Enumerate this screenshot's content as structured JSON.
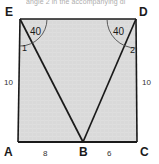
{
  "figure": {
    "caption": "angle 2 in the accompanying di",
    "shape_type": "quadrilateral-with-inscribed-triangle",
    "fill_color": "#d9d9d9",
    "stroke_color": "#1a1a1a",
    "arc_color": "#555555",
    "vertices": [
      {
        "id": "E",
        "label": "E",
        "x": 20,
        "y": 19
      },
      {
        "id": "D",
        "label": "D",
        "x": 136,
        "y": 19
      },
      {
        "id": "A",
        "label": "A",
        "x": 18,
        "y": 142
      },
      {
        "id": "B",
        "label": "B",
        "x": 83,
        "y": 142
      },
      {
        "id": "C",
        "label": "C",
        "x": 137,
        "y": 142
      }
    ],
    "segments": [
      {
        "id": "EB",
        "from": "E",
        "to": "B"
      },
      {
        "id": "DB",
        "from": "D",
        "to": "B"
      }
    ],
    "side_labels": [
      {
        "id": "AE",
        "text": "10",
        "side": "left"
      },
      {
        "id": "DC",
        "text": "10",
        "side": "right"
      },
      {
        "id": "AB",
        "text": "8",
        "side": "bottom-left"
      },
      {
        "id": "BC",
        "text": "6",
        "side": "bottom-right"
      }
    ],
    "angle_labels": [
      {
        "id": "angle-at-E",
        "text": "40",
        "vertex": "E"
      },
      {
        "id": "angle-at-D",
        "text": "40",
        "vertex": "D"
      }
    ],
    "numbered_angles": [
      {
        "id": "angle-1",
        "text": "1",
        "vertex": "E"
      },
      {
        "id": "angle-2",
        "text": "2",
        "vertex": "D"
      }
    ]
  }
}
